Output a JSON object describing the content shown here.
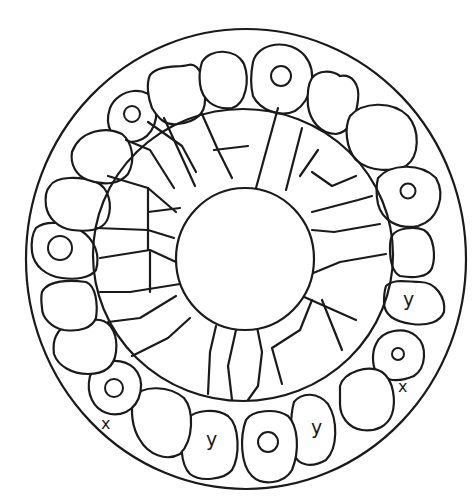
{
  "figure": {
    "type": "histological cross-section line drawing",
    "colors": {
      "ink": "#1a1a1a",
      "background": "#ffffff"
    },
    "structures": {
      "outer_boundary": "outer-membrane",
      "peripheral_cells_ring": "outer cell layer",
      "radial_cells_ring": "inner radial cell layer",
      "central_lumen": "lumen"
    },
    "labels": [
      {
        "id": "y1",
        "text": "y",
        "x": 403,
        "y": 290
      },
      {
        "id": "x1",
        "text": "x",
        "x": 398,
        "y": 379
      },
      {
        "id": "y2",
        "text": "y",
        "x": 311,
        "y": 418
      },
      {
        "id": "y3",
        "text": "y",
        "x": 206,
        "y": 430
      },
      {
        "id": "x2",
        "text": "x",
        "x": 101,
        "y": 416
      }
    ]
  }
}
